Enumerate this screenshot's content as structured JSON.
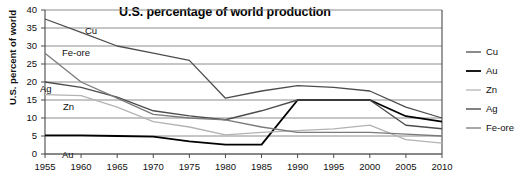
{
  "chart_data": {
    "type": "line",
    "title": "U.S. percentage of world production",
    "xlabel": "",
    "ylabel": "U.S. percent of world",
    "x": [
      1955,
      1960,
      1965,
      1970,
      1975,
      1980,
      1985,
      1990,
      1995,
      2000,
      2005,
      2010
    ],
    "xtick_labels": [
      "1955",
      "1960",
      "1965",
      "1970",
      "1975",
      "1980",
      "1985",
      "1990",
      "1995",
      "2000",
      "2005",
      "2010"
    ],
    "ytick_labels": [
      "0",
      "5",
      "10",
      "15",
      "20",
      "25",
      "30",
      "35",
      "40"
    ],
    "xlim": [
      1955,
      2010
    ],
    "ylim": [
      0,
      40
    ],
    "ytick_step": 5,
    "grid": "horizontal",
    "legend_position": "right",
    "series": [
      {
        "name": "Cu",
        "color": "#4d4d4d",
        "width": 1.3,
        "values": [
          37.5,
          33.8,
          30.0,
          28.0,
          26.0,
          15.5,
          17.5,
          19.0,
          18.5,
          17.5,
          13.0,
          10.0
        ]
      },
      {
        "name": "Au",
        "color": "#000000",
        "width": 1.8,
        "values": [
          5.2,
          5.2,
          5.0,
          4.8,
          3.5,
          2.6,
          2.6,
          15.0,
          15.0,
          15.0,
          10.5,
          9.0
        ]
      },
      {
        "name": "Zn",
        "color": "#b3b3b3",
        "width": 1.3,
        "values": [
          16.5,
          16.2,
          13.0,
          9.0,
          7.5,
          5.3,
          6.0,
          6.5,
          7.0,
          8.0,
          4.0,
          3.0
        ]
      },
      {
        "name": "Ag",
        "color": "#4d4d4d",
        "width": 1.4,
        "values": [
          20.0,
          18.5,
          15.8,
          12.0,
          10.6,
          9.5,
          12.0,
          15.0,
          15.0,
          15.0,
          8.0,
          7.0
        ]
      },
      {
        "name": "Fe-ore",
        "color": "#7a7a7a",
        "width": 1.3,
        "values": [
          28.0,
          20.0,
          15.5,
          11.0,
          10.0,
          9.5,
          7.5,
          6.0,
          6.0,
          6.0,
          5.5,
          5.0
        ]
      }
    ],
    "inline_annotations": [
      {
        "text": "Cu",
        "x_px": 85,
        "y_px": 34
      },
      {
        "text": "Fe-ore",
        "x_px": 62,
        "y_px": 56
      },
      {
        "text": "Ag",
        "x_px": 40,
        "y_px": 92
      },
      {
        "text": "Zn",
        "x_px": 63,
        "y_px": 110
      },
      {
        "text": "Au",
        "x_px": 62,
        "y_px": 158
      }
    ],
    "legend_entries": [
      "Cu",
      "Au",
      "Zn",
      "Ag",
      "Fe-ore"
    ]
  }
}
